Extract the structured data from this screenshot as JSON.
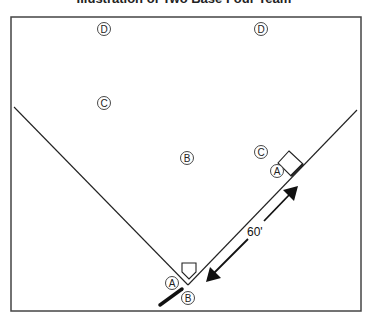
{
  "title": "Illustration of Two Base Four Team",
  "diagram": {
    "frame": {
      "x": 11,
      "y": 17,
      "width": 350,
      "height": 294,
      "stroke": "#444444"
    },
    "foul_lines": {
      "apex": {
        "x": 188,
        "y": 285
      },
      "left_end": {
        "x": 14,
        "y": 107
      },
      "right_end": {
        "x": 357,
        "y": 110
      }
    },
    "positions": [
      {
        "id": "D1",
        "letter": "D",
        "x": 104,
        "y": 29
      },
      {
        "id": "D2",
        "letter": "D",
        "x": 261,
        "y": 29
      },
      {
        "id": "C1",
        "letter": "C",
        "x": 104,
        "y": 103
      },
      {
        "id": "C2",
        "letter": "C",
        "x": 261,
        "y": 152
      },
      {
        "id": "B1",
        "letter": "B",
        "x": 187,
        "y": 158
      },
      {
        "id": "A1",
        "letter": "A",
        "x": 277,
        "y": 171
      },
      {
        "id": "A2",
        "letter": "A",
        "x": 172,
        "y": 283
      },
      {
        "id": "B2",
        "letter": "B",
        "x": 188,
        "y": 298
      }
    ],
    "distance_label": "60'",
    "legend_letters": [
      "A",
      "B",
      "C",
      "D"
    ]
  }
}
